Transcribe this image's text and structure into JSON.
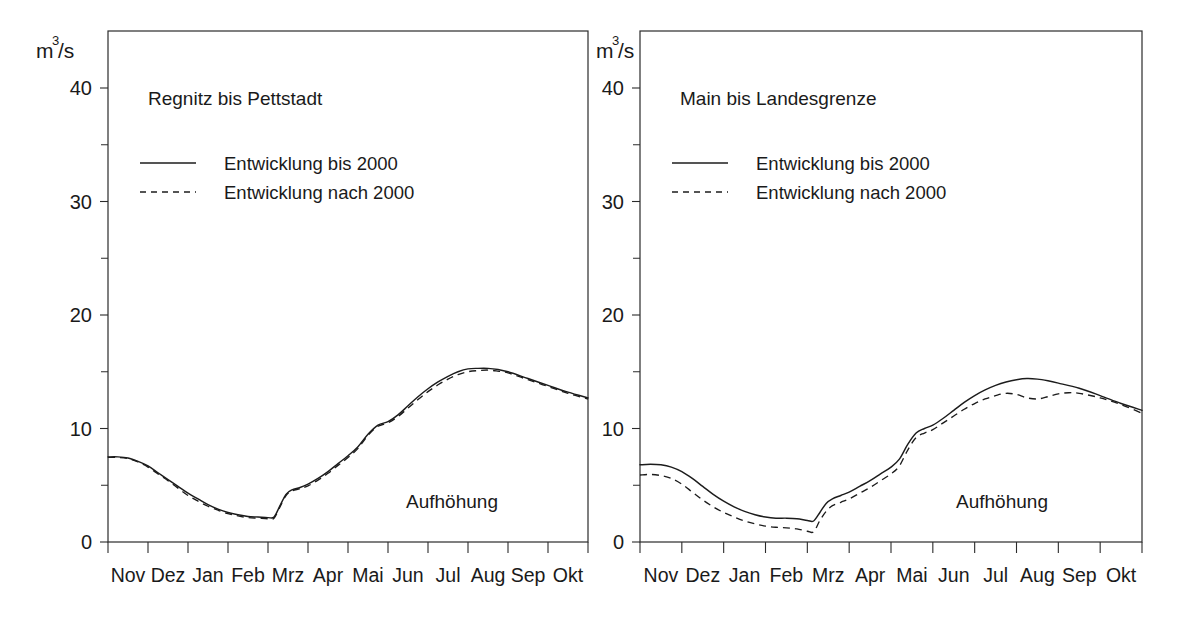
{
  "figure": {
    "background_color": "#ffffff",
    "line_color": "#1c1c1c",
    "panel_count": 2
  },
  "chart_data": [
    {
      "type": "line",
      "title": "Regnitz bis Pettstadt",
      "xlabel": "",
      "ylabel": "m3/s",
      "ylabel_base": "m",
      "ylabel_exponent": "3",
      "ylabel_suffix": "/s",
      "annotation": "Aufhöhung",
      "grid": false,
      "legend_position": "top-left",
      "xlim": [
        0,
        12
      ],
      "ylim": [
        0,
        42
      ],
      "yticks_major": [
        0,
        10,
        20,
        30,
        40
      ],
      "yticks_minor": [
        5,
        15,
        25,
        35
      ],
      "ytick_labels": [
        "0",
        "10",
        "20",
        "30",
        "40"
      ],
      "categories": [
        "Nov",
        "Dez",
        "Jan",
        "Feb",
        "Mrz",
        "Apr",
        "Mai",
        "Jun",
        "Jul",
        "Aug",
        "Sep",
        "Okt"
      ],
      "series": [
        {
          "name": "Entwicklung bis 2000",
          "style": "solid",
          "x": [
            0,
            0.25,
            0.5,
            0.75,
            1,
            1.25,
            1.5,
            1.75,
            2,
            2.25,
            2.5,
            2.75,
            3,
            3.25,
            3.5,
            3.75,
            4,
            4.15,
            4.3,
            4.45,
            4.6,
            4.8,
            5,
            5.25,
            5.5,
            5.75,
            6,
            6.25,
            6.5,
            6.75,
            7,
            7.25,
            7.5,
            7.75,
            8,
            8.25,
            8.5,
            8.75,
            9,
            9.25,
            9.5,
            9.75,
            10,
            10.5,
            11,
            11.5,
            12
          ],
          "values": [
            7.5,
            7.5,
            7.4,
            7.1,
            6.7,
            6.1,
            5.5,
            4.9,
            4.3,
            3.8,
            3.3,
            2.9,
            2.6,
            2.4,
            2.25,
            2.2,
            2.15,
            2.2,
            3.2,
            4.2,
            4.6,
            4.8,
            5.1,
            5.6,
            6.2,
            6.9,
            7.6,
            8.4,
            9.5,
            10.3,
            10.6,
            11.2,
            12.0,
            12.8,
            13.5,
            14.1,
            14.6,
            15.0,
            15.25,
            15.3,
            15.3,
            15.2,
            15.0,
            14.4,
            13.8,
            13.2,
            12.7
          ]
        },
        {
          "name": "Entwicklung nach 2000",
          "style": "dashed",
          "x": [
            0,
            0.25,
            0.5,
            0.75,
            1,
            1.25,
            1.5,
            1.75,
            2,
            2.25,
            2.5,
            2.75,
            3,
            3.25,
            3.5,
            3.75,
            4,
            4.15,
            4.3,
            4.45,
            4.6,
            4.8,
            5,
            5.25,
            5.5,
            5.75,
            6,
            6.25,
            6.5,
            6.75,
            7,
            7.25,
            7.5,
            7.75,
            8,
            8.25,
            8.5,
            8.75,
            9,
            9.25,
            9.5,
            9.75,
            10,
            10.5,
            11,
            11.5,
            12
          ],
          "values": [
            7.45,
            7.45,
            7.35,
            7.05,
            6.6,
            6.0,
            5.4,
            4.75,
            4.1,
            3.6,
            3.15,
            2.8,
            2.5,
            2.3,
            2.15,
            2.1,
            2.05,
            2.1,
            3.1,
            4.1,
            4.5,
            4.7,
            4.95,
            5.45,
            6.05,
            6.75,
            7.45,
            8.25,
            9.4,
            10.2,
            10.5,
            11.05,
            11.8,
            12.55,
            13.25,
            13.85,
            14.35,
            14.75,
            15.0,
            15.1,
            15.15,
            15.05,
            14.9,
            14.3,
            13.7,
            13.1,
            12.6
          ]
        }
      ]
    },
    {
      "type": "line",
      "title": "Main bis Landesgrenze",
      "xlabel": "",
      "ylabel": "m3/s",
      "ylabel_base": "m",
      "ylabel_exponent": "3",
      "ylabel_suffix": "/s",
      "annotation": "Aufhöhung",
      "grid": false,
      "legend_position": "top-left",
      "xlim": [
        0,
        12
      ],
      "ylim": [
        0,
        42
      ],
      "yticks_major": [
        0,
        10,
        20,
        30,
        40
      ],
      "yticks_minor": [
        5,
        15,
        25,
        35
      ],
      "ytick_labels": [
        "0",
        "10",
        "20",
        "30",
        "40"
      ],
      "categories": [
        "Nov",
        "Dez",
        "Jan",
        "Feb",
        "Mrz",
        "Apr",
        "Mai",
        "Jun",
        "Jul",
        "Aug",
        "Sep",
        "Okt"
      ],
      "series": [
        {
          "name": "Entwicklung bis 2000",
          "style": "solid",
          "x": [
            0,
            0.25,
            0.5,
            0.75,
            1,
            1.25,
            1.5,
            1.75,
            2,
            2.25,
            2.5,
            2.75,
            3,
            3.25,
            3.5,
            3.75,
            4,
            4.15,
            4.3,
            4.45,
            4.6,
            4.8,
            5,
            5.25,
            5.5,
            5.75,
            6,
            6.2,
            6.4,
            6.6,
            6.8,
            7,
            7.25,
            7.5,
            7.75,
            8,
            8.25,
            8.5,
            8.75,
            9,
            9.25,
            9.5,
            9.75,
            10,
            10.5,
            11,
            11.5,
            12
          ],
          "values": [
            6.8,
            6.85,
            6.8,
            6.6,
            6.2,
            5.6,
            4.9,
            4.2,
            3.6,
            3.1,
            2.7,
            2.4,
            2.2,
            2.1,
            2.1,
            2.05,
            1.9,
            1.85,
            2.6,
            3.4,
            3.8,
            4.1,
            4.4,
            4.9,
            5.4,
            6.0,
            6.6,
            7.3,
            8.6,
            9.6,
            10.0,
            10.3,
            10.9,
            11.6,
            12.3,
            12.9,
            13.4,
            13.8,
            14.1,
            14.3,
            14.4,
            14.35,
            14.2,
            14.0,
            13.55,
            12.9,
            12.2,
            11.6
          ]
        },
        {
          "name": "Entwicklung nach 2000",
          "style": "dashed",
          "x": [
            0,
            0.25,
            0.5,
            0.75,
            1,
            1.25,
            1.5,
            1.75,
            2,
            2.25,
            2.5,
            2.75,
            3,
            3.25,
            3.5,
            3.75,
            4,
            4.15,
            4.3,
            4.45,
            4.6,
            4.8,
            5,
            5.25,
            5.5,
            5.75,
            6,
            6.2,
            6.4,
            6.6,
            6.8,
            7,
            7.25,
            7.5,
            7.75,
            8,
            8.25,
            8.5,
            8.75,
            9,
            9.25,
            9.5,
            9.75,
            10,
            10.25,
            10.5,
            11,
            11.5,
            12
          ],
          "values": [
            5.9,
            5.95,
            5.85,
            5.6,
            5.1,
            4.4,
            3.7,
            3.1,
            2.6,
            2.2,
            1.85,
            1.6,
            1.4,
            1.3,
            1.25,
            1.15,
            0.95,
            0.9,
            1.9,
            2.7,
            3.2,
            3.5,
            3.8,
            4.3,
            4.8,
            5.4,
            6.0,
            6.7,
            8.1,
            9.2,
            9.6,
            9.9,
            10.5,
            11.1,
            11.7,
            12.2,
            12.6,
            12.9,
            13.1,
            13.0,
            12.7,
            12.6,
            12.8,
            13.05,
            13.15,
            13.1,
            12.7,
            12.1,
            11.35
          ]
        }
      ]
    }
  ]
}
